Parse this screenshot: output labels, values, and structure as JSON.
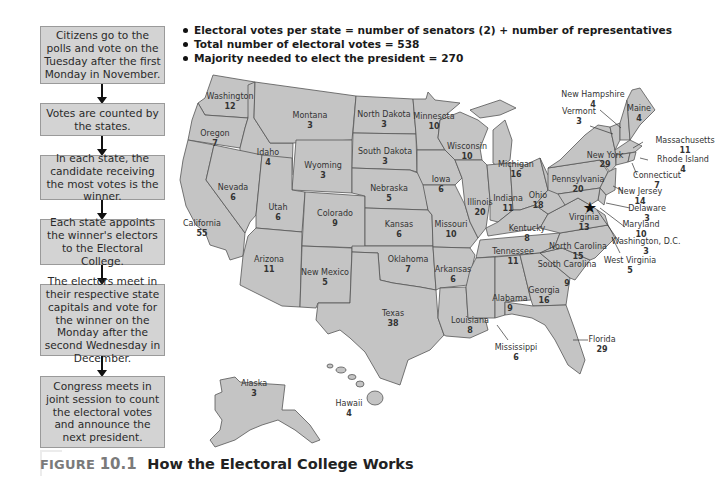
{
  "flowchart": {
    "steps": [
      "Citizens go to the polls and vote on the Tuesday after the first Monday in November.",
      "Votes are counted by the states.",
      "In each state, the candidate receiving the most votes is the winner.",
      "Each state appoints the winner's electors to the Electoral College.",
      "The electors meet in their respective state capitals and vote for the winner on the Monday after the second Wednesday in December.",
      "Congress meets in joint session to count the electoral votes and announce the next president."
    ]
  },
  "facts": [
    "Electoral votes per state = number of senators (2) + number of representatives",
    "Total number of electoral votes = 538",
    "Majority needed to elect the president = 270"
  ],
  "states": {
    "washington": {
      "name": "Washington",
      "votes": "12"
    },
    "oregon": {
      "name": "Oregon",
      "votes": "7"
    },
    "california": {
      "name": "California",
      "votes": "55"
    },
    "idaho": {
      "name": "Idaho",
      "votes": "4"
    },
    "nevada": {
      "name": "Nevada",
      "votes": "6"
    },
    "montana": {
      "name": "Montana",
      "votes": "3"
    },
    "wyoming": {
      "name": "Wyoming",
      "votes": "3"
    },
    "utah": {
      "name": "Utah",
      "votes": "6"
    },
    "arizona": {
      "name": "Arizona",
      "votes": "11"
    },
    "colorado": {
      "name": "Colorado",
      "votes": "9"
    },
    "new_mexico": {
      "name": "New Mexico",
      "votes": "5"
    },
    "north_dakota": {
      "name": "North Dakota",
      "votes": "3"
    },
    "south_dakota": {
      "name": "South Dakota",
      "votes": "3"
    },
    "nebraska": {
      "name": "Nebraska",
      "votes": "5"
    },
    "kansas": {
      "name": "Kansas",
      "votes": "6"
    },
    "oklahoma": {
      "name": "Oklahoma",
      "votes": "7"
    },
    "texas": {
      "name": "Texas",
      "votes": "38"
    },
    "minnesota": {
      "name": "Minnesota",
      "votes": "10"
    },
    "iowa": {
      "name": "Iowa",
      "votes": "6"
    },
    "missouri": {
      "name": "Missouri",
      "votes": "10"
    },
    "arkansas": {
      "name": "Arkansas",
      "votes": "6"
    },
    "louisiana": {
      "name": "Louisiana",
      "votes": "8"
    },
    "wisconsin": {
      "name": "Wisconsin",
      "votes": "10"
    },
    "illinois": {
      "name": "Illinois",
      "votes": "20"
    },
    "michigan": {
      "name": "Michigan",
      "votes": "16"
    },
    "indiana": {
      "name": "Indiana",
      "votes": "11"
    },
    "ohio": {
      "name": "Ohio",
      "votes": "18"
    },
    "kentucky": {
      "name": "Kentucky",
      "votes": "8"
    },
    "tennessee": {
      "name": "Tennessee",
      "votes": "11"
    },
    "mississippi": {
      "name": "Mississippi",
      "votes": "6"
    },
    "alabama": {
      "name": "Alabama",
      "votes": "9"
    },
    "georgia": {
      "name": "Georgia",
      "votes": "16"
    },
    "florida": {
      "name": "Florida",
      "votes": "29"
    },
    "south_carolina": {
      "name": "South Carolina",
      "votes": "9"
    },
    "north_carolina": {
      "name": "North Carolina",
      "votes": "15"
    },
    "virginia": {
      "name": "Virginia",
      "votes": "13"
    },
    "west_virginia": {
      "name": "West Virginia",
      "votes": "5"
    },
    "pennsylvania": {
      "name": "Pennsylvania",
      "votes": "20"
    },
    "new_york": {
      "name": "New York",
      "votes": "29"
    },
    "vermont": {
      "name": "Vermont",
      "votes": "3"
    },
    "new_hampshire": {
      "name": "New Hampshire",
      "votes": "4"
    },
    "maine": {
      "name": "Maine",
      "votes": "4"
    },
    "massachusetts": {
      "name": "Massachusetts",
      "votes": "11"
    },
    "rhode_island": {
      "name": "Rhode Island",
      "votes": "4"
    },
    "connecticut": {
      "name": "Connecticut",
      "votes": "7"
    },
    "new_jersey": {
      "name": "New Jersey",
      "votes": "14"
    },
    "delaware": {
      "name": "Delaware",
      "votes": "3"
    },
    "maryland": {
      "name": "Maryland",
      "votes": "10"
    },
    "washington_dc": {
      "name": "Washington, D.C.",
      "votes": "3"
    },
    "alaska": {
      "name": "Alaska",
      "votes": "3"
    },
    "hawaii": {
      "name": "Hawaii",
      "votes": "4"
    }
  },
  "colors": {
    "state_fill": "#c4c4c4",
    "state_border": "#555555",
    "box_fill": "#d3d3d3",
    "caption_gray": "#7a7a7a"
  },
  "caption": {
    "figure_word": "FIGURE",
    "figure_number": "10.1",
    "title": "How the Electoral College Works"
  }
}
